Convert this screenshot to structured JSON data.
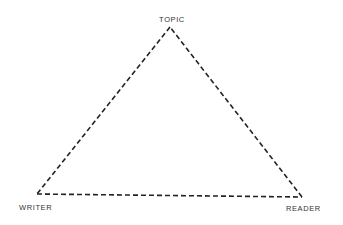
{
  "diagram": {
    "type": "triangle",
    "line_style": "dashed",
    "line_color": "#222222",
    "nodes": [
      {
        "id": "topic",
        "label": "TOPIC",
        "position": "top"
      },
      {
        "id": "writer",
        "label": "WRITER",
        "position": "bottom-left"
      },
      {
        "id": "reader",
        "label": "READER",
        "position": "bottom-right"
      }
    ],
    "edges": [
      {
        "from": "topic",
        "to": "writer"
      },
      {
        "from": "writer",
        "to": "reader"
      },
      {
        "from": "reader",
        "to": "topic"
      }
    ]
  }
}
